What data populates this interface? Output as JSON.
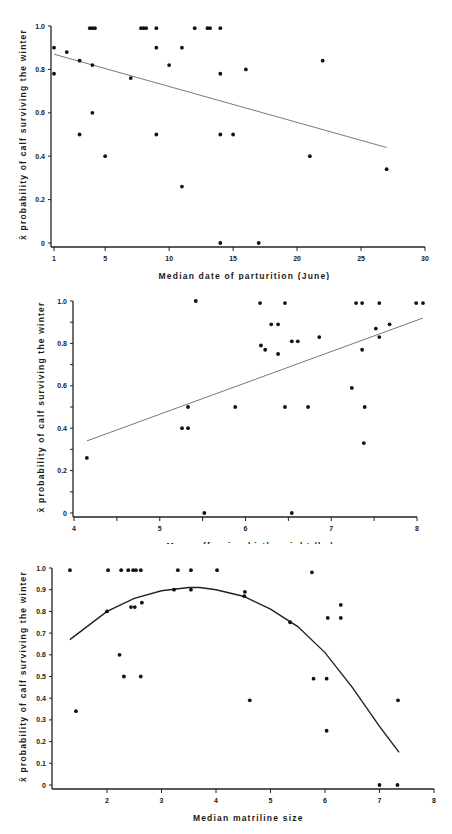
{
  "chart_data": [
    {
      "type": "scatter",
      "title": "",
      "xlabel": "Median date of parturition (June)",
      "ylabel": "x̄ probability of calf surviving the winter",
      "xlim": [
        1,
        30
      ],
      "ylim": [
        0,
        1.0
      ],
      "xticks": [
        1,
        5,
        10,
        15,
        20,
        25,
        30
      ],
      "xtick_labels": [
        "1",
        "5",
        "10",
        "15",
        "20",
        "25",
        "30"
      ],
      "yticks": [
        0,
        0.2,
        0.4,
        0.6,
        0.8,
        1.0
      ],
      "ytick_labels": [
        "0",
        "0.2",
        "0.4",
        "0.6",
        "0.8",
        "1.0"
      ],
      "grid": false,
      "points": [
        [
          1,
          0.9
        ],
        [
          1,
          0.78
        ],
        [
          2,
          0.88
        ],
        [
          3,
          0.84
        ],
        [
          3,
          0.5
        ],
        [
          4,
          0.82
        ],
        [
          4,
          0.6
        ],
        [
          3.8,
          0.99
        ],
        [
          4,
          0.99
        ],
        [
          4.2,
          0.99
        ],
        [
          5,
          0.4
        ],
        [
          7,
          0.76
        ],
        [
          7.8,
          0.99
        ],
        [
          8,
          0.99
        ],
        [
          8.2,
          0.99
        ],
        [
          9,
          0.99
        ],
        [
          9,
          0.9
        ],
        [
          9,
          0.5
        ],
        [
          10,
          0.82
        ],
        [
          11,
          0.9
        ],
        [
          11,
          0.26
        ],
        [
          12,
          0.99
        ],
        [
          13,
          0.99
        ],
        [
          13.2,
          0.99
        ],
        [
          14,
          0.99
        ],
        [
          14,
          0.78
        ],
        [
          14,
          0.5
        ],
        [
          14,
          0
        ],
        [
          15,
          0.5
        ],
        [
          16,
          0.8
        ],
        [
          17,
          0
        ],
        [
          21,
          0.4
        ],
        [
          22,
          0.84
        ],
        [
          27,
          0.34
        ]
      ],
      "fit": {
        "kind": "linear",
        "line": [
          [
            1,
            0.87
          ],
          [
            27,
            0.44
          ]
        ]
      }
    },
    {
      "type": "scatter",
      "title": "",
      "xlabel": "Mean offspring birth weight (kg)",
      "ylabel": "x̄ probability of calf surviving the winter",
      "xlim": [
        4,
        8
      ],
      "ylim": [
        0,
        1.0
      ],
      "xticks": [
        4,
        4.5,
        5,
        5.5,
        6,
        6.5,
        7,
        7.5,
        8
      ],
      "xtick_labels": [
        "4",
        "",
        "5",
        "",
        "6",
        "",
        "7",
        "",
        "8"
      ],
      "yticks": [
        0,
        0.1,
        0.2,
        0.3,
        0.4,
        0.5,
        0.6,
        0.7,
        0.8,
        0.9,
        1.0
      ],
      "ytick_labels": [
        "0",
        "",
        "0.2",
        "",
        "0.4",
        "",
        "0.6",
        "",
        "0.8",
        "",
        "1.0"
      ],
      "grid": false,
      "points": [
        [
          4.15,
          0.26
        ],
        [
          5.26,
          0.4
        ],
        [
          5.33,
          0.4
        ],
        [
          5.33,
          0.5
        ],
        [
          5.42,
          1.0
        ],
        [
          5.52,
          0
        ],
        [
          5.88,
          0.5
        ],
        [
          6.17,
          0.99
        ],
        [
          6.18,
          0.79
        ],
        [
          6.23,
          0.77
        ],
        [
          6.3,
          0.89
        ],
        [
          6.38,
          0.89
        ],
        [
          6.38,
          0.75
        ],
        [
          6.46,
          0.99
        ],
        [
          6.46,
          0.5
        ],
        [
          6.54,
          0.81
        ],
        [
          6.54,
          0
        ],
        [
          6.61,
          0.81
        ],
        [
          6.73,
          0.5
        ],
        [
          6.86,
          0.83
        ],
        [
          7.24,
          0.59
        ],
        [
          7.29,
          0.99
        ],
        [
          7.36,
          0.99
        ],
        [
          7.36,
          0.77
        ],
        [
          7.39,
          0.5
        ],
        [
          7.38,
          0.33
        ],
        [
          7.52,
          0.87
        ],
        [
          7.56,
          0.83
        ],
        [
          7.56,
          0.99
        ],
        [
          7.68,
          0.89
        ],
        [
          7.99,
          0.99
        ],
        [
          8.07,
          0.99
        ]
      ],
      "fit": {
        "kind": "linear",
        "line": [
          [
            4.15,
            0.34
          ],
          [
            8.07,
            0.92
          ]
        ]
      }
    },
    {
      "type": "scatter",
      "title": "",
      "xlabel": "Median matriline size",
      "ylabel": "x̄ probability of calf surviving the winter",
      "xlim": [
        1,
        8
      ],
      "ylim": [
        0,
        1.0
      ],
      "xticks": [
        2,
        3,
        4,
        5,
        6,
        7,
        8
      ],
      "xtick_labels": [
        "2",
        "3",
        "4",
        "5",
        "6",
        "7",
        "8"
      ],
      "yticks": [
        0,
        0.1,
        0.2,
        0.3,
        0.4,
        0.5,
        0.6,
        0.7,
        0.8,
        0.9,
        1.0
      ],
      "ytick_labels": [
        "0",
        "0.1",
        "0.2",
        "0.3",
        "0.4",
        "0.5",
        "0.6",
        "0.7",
        "0.8",
        "0.9",
        "1.0"
      ],
      "grid": false,
      "points": [
        [
          1.32,
          0.99
        ],
        [
          1.43,
          0.34
        ],
        [
          2.02,
          0.99
        ],
        [
          2.0,
          0.8
        ],
        [
          2.26,
          0.99
        ],
        [
          2.23,
          0.6
        ],
        [
          2.31,
          0.5
        ],
        [
          2.39,
          0.99
        ],
        [
          2.44,
          0.82
        ],
        [
          2.51,
          0.82
        ],
        [
          2.48,
          0.99
        ],
        [
          2.53,
          0.99
        ],
        [
          2.62,
          0.99
        ],
        [
          2.64,
          0.84
        ],
        [
          2.62,
          0.5
        ],
        [
          3.23,
          0.9
        ],
        [
          3.3,
          0.99
        ],
        [
          3.54,
          0.99
        ],
        [
          3.54,
          0.9
        ],
        [
          4.02,
          0.99
        ],
        [
          4.53,
          0.89
        ],
        [
          4.52,
          0.87
        ],
        [
          4.62,
          0.39
        ],
        [
          5.36,
          0.75
        ],
        [
          5.76,
          0.98
        ],
        [
          5.79,
          0.49
        ],
        [
          6.03,
          0.49
        ],
        [
          6.03,
          0.25
        ],
        [
          6.05,
          0.77
        ],
        [
          6.29,
          0.83
        ],
        [
          6.29,
          0.77
        ],
        [
          7.0,
          0
        ],
        [
          7.33,
          0
        ],
        [
          7.34,
          0.39
        ]
      ],
      "fit": {
        "kind": "quadratic",
        "line": [
          [
            1.32,
            0.67
          ],
          [
            2.0,
            0.8
          ],
          [
            2.5,
            0.86
          ],
          [
            3.0,
            0.895
          ],
          [
            3.5,
            0.91
          ],
          [
            3.7,
            0.91
          ],
          [
            4.0,
            0.9
          ],
          [
            4.5,
            0.87
          ],
          [
            5.0,
            0.81
          ],
          [
            5.5,
            0.73
          ],
          [
            6.0,
            0.61
          ],
          [
            6.5,
            0.45
          ],
          [
            7.0,
            0.27
          ],
          [
            7.36,
            0.15
          ]
        ]
      }
    }
  ],
  "layout": [
    {
      "top": 0,
      "height": 280,
      "plot": {
        "x0": 54,
        "x1": 425,
        "y0": 243,
        "y1": 26
      },
      "axis_y": 247,
      "axis_x": 51
    },
    {
      "top": 280,
      "height": 264,
      "plot": {
        "x0": 74,
        "x1": 417,
        "y0": 233,
        "y1": 21
      },
      "axis_y": 237,
      "axis_x": 73
    },
    {
      "top": 544,
      "height": 290,
      "plot": {
        "x0": 52.5,
        "x1": 434,
        "y0": 241,
        "y1": 24
      },
      "axis_y": 245,
      "axis_x": 52
    }
  ]
}
